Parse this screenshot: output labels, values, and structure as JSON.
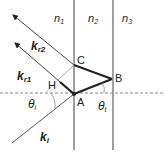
{
  "diagram": {
    "media_labels": {
      "n1": "n",
      "n1_sub": "1",
      "n2": "n",
      "n2_sub": "2",
      "n3": "n",
      "n3_sub": "3"
    },
    "vectors": {
      "kr2": "k",
      "kr2_sub": "r2",
      "kr1": "k",
      "kr1_sub": "r1",
      "ki": "k",
      "ki_sub": "i"
    },
    "points": {
      "A": "A",
      "B": "B",
      "C": "C",
      "H": "H"
    },
    "angles": {
      "theta_i": "θ",
      "theta_i_sub": "i",
      "theta_t": "θ",
      "theta_t_sub": "t"
    },
    "colors": {
      "line": "#222222",
      "gray": "#999999",
      "boundary": "#888888"
    }
  }
}
